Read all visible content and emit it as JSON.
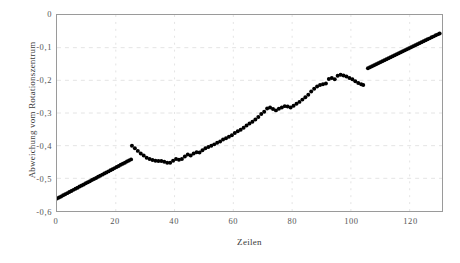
{
  "chart_data": {
    "type": "scatter",
    "title": "",
    "xlabel": "Zeilen",
    "ylabel": "Abweichung vom Rotationszentrum",
    "xlim": [
      0,
      131
    ],
    "ylim": [
      -0.6,
      0
    ],
    "xticks": [
      0,
      20,
      40,
      60,
      80,
      100,
      120
    ],
    "xticklabels": [
      "0",
      "20",
      "40",
      "60",
      "80",
      "100",
      "120"
    ],
    "yticks": [
      0,
      -0.1,
      -0.2,
      -0.3,
      -0.4,
      -0.5,
      -0.6
    ],
    "yticklabels": [
      "0",
      "-0,1",
      "-0,2",
      "-0,3",
      "-0,4",
      "-0,5",
      "-0,6"
    ],
    "grid": true,
    "grid_style": "dotted",
    "grid_color": "#e4e4e4",
    "marker_color": "#000000",
    "marker_size": 2.0,
    "frame_color": "#9a9a9a",
    "background": "#ffffff",
    "series": [
      {
        "name": "segment-1-linear",
        "comment": "dense straight ramp, left",
        "x": [
          0,
          0.7,
          1.4,
          2.1,
          2.8,
          3.5,
          4.2,
          4.9,
          5.6,
          6.3,
          7,
          7.7,
          8.4,
          9.1,
          9.8,
          10.5,
          11.2,
          11.9,
          12.6,
          13.3,
          14,
          14.7,
          15.4,
          16.1,
          16.8,
          17.5,
          18.2,
          18.9,
          19.6,
          20.3,
          21,
          21.7,
          22.4,
          23.1,
          23.8,
          24.5,
          25.2
        ],
        "y": [
          -0.562,
          -0.5587,
          -0.5553,
          -0.552,
          -0.5487,
          -0.5453,
          -0.542,
          -0.5387,
          -0.5353,
          -0.532,
          -0.5287,
          -0.5253,
          -0.522,
          -0.5187,
          -0.5153,
          -0.512,
          -0.5087,
          -0.5053,
          -0.502,
          -0.4987,
          -0.4953,
          -0.492,
          -0.4887,
          -0.4853,
          -0.482,
          -0.4787,
          -0.4753,
          -0.472,
          -0.4687,
          -0.4653,
          -0.462,
          -0.4587,
          -0.4553,
          -0.452,
          -0.4487,
          -0.4453,
          -0.442
        ]
      },
      {
        "name": "segment-2-noisy",
        "comment": "scattered measurement points, middle",
        "x": [
          25.5,
          26.5,
          27.5,
          28.5,
          29.5,
          30.5,
          31.5,
          32.5,
          33.5,
          34.5,
          35.5,
          36.5,
          37.5,
          38.5,
          39.5,
          40.5,
          41.5,
          42.5,
          43.5,
          44.5,
          45.5,
          46.5,
          47.5,
          48.5,
          49.5,
          50.5,
          51.5,
          52.5,
          53.5,
          54.5,
          55.5,
          56.5,
          57.5,
          58.5,
          59.5,
          60.5,
          61.5,
          62.5,
          63.5,
          64.5,
          65.5,
          66.5,
          67.5,
          68.5,
          69.5,
          70.5,
          71.5,
          72.5,
          73.5,
          74.5,
          75.5,
          76.5,
          77.5,
          78.5,
          79.5,
          80.5,
          81.5,
          82.5,
          83.5,
          84.5,
          85.5,
          86.5,
          87.5,
          88.5,
          89.5,
          90.5,
          91.5,
          92.5,
          93.5,
          94.5,
          95.5,
          96.5,
          97.5,
          98.5,
          99.5,
          100.5,
          101.5,
          102.5,
          103.5,
          104.2
        ],
        "y": [
          -0.4,
          -0.408,
          -0.416,
          -0.424,
          -0.43,
          -0.437,
          -0.441,
          -0.444,
          -0.446,
          -0.447,
          -0.447,
          -0.449,
          -0.452,
          -0.452,
          -0.446,
          -0.441,
          -0.443,
          -0.441,
          -0.433,
          -0.427,
          -0.43,
          -0.424,
          -0.42,
          -0.421,
          -0.414,
          -0.408,
          -0.404,
          -0.4,
          -0.396,
          -0.391,
          -0.387,
          -0.381,
          -0.377,
          -0.373,
          -0.368,
          -0.361,
          -0.356,
          -0.351,
          -0.345,
          -0.338,
          -0.332,
          -0.327,
          -0.32,
          -0.312,
          -0.303,
          -0.296,
          -0.286,
          -0.283,
          -0.288,
          -0.292,
          -0.287,
          -0.283,
          -0.279,
          -0.28,
          -0.283,
          -0.278,
          -0.272,
          -0.266,
          -0.259,
          -0.252,
          -0.244,
          -0.234,
          -0.226,
          -0.219,
          -0.214,
          -0.212,
          -0.21,
          -0.196,
          -0.193,
          -0.197,
          -0.186,
          -0.183,
          -0.185,
          -0.188,
          -0.193,
          -0.197,
          -0.203,
          -0.208,
          -0.212,
          -0.214
        ]
      },
      {
        "name": "segment-3-linear",
        "comment": "dense straight ramp, right",
        "x": [
          105.8,
          106.5,
          107.2,
          107.9,
          108.6,
          109.3,
          110,
          110.7,
          111.4,
          112.1,
          112.8,
          113.5,
          114.2,
          114.9,
          115.6,
          116.3,
          117,
          117.7,
          118.4,
          119.1,
          119.8,
          120.5,
          121.2,
          121.9,
          122.6,
          123.3,
          124,
          124.7,
          125.4,
          126.1,
          126.8,
          127.5,
          128.2,
          128.9,
          129.6,
          130.2
        ],
        "y": [
          -0.163,
          -0.1599,
          -0.1569,
          -0.1538,
          -0.1508,
          -0.1477,
          -0.1447,
          -0.1416,
          -0.1386,
          -0.1355,
          -0.1325,
          -0.1294,
          -0.1264,
          -0.1233,
          -0.1203,
          -0.1172,
          -0.1142,
          -0.1111,
          -0.1081,
          -0.105,
          -0.102,
          -0.0989,
          -0.0959,
          -0.0928,
          -0.0898,
          -0.0867,
          -0.0837,
          -0.0806,
          -0.0776,
          -0.0745,
          -0.0715,
          -0.0684,
          -0.0654,
          -0.0623,
          -0.0593,
          -0.0567
        ]
      }
    ]
  }
}
